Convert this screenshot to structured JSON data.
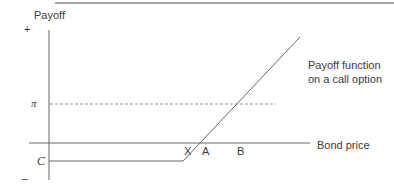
{
  "diagram": {
    "y_axis": {
      "label": "Payoff",
      "plus": "+",
      "minus": "–"
    },
    "x_axis": {
      "label": "Bond price"
    },
    "levels": {
      "pi": "π",
      "c": "C"
    },
    "points": [
      "X",
      "A",
      "B"
    ],
    "curve_label_line1": "Payoff function",
    "curve_label_line2": "on a call option",
    "colors": {
      "line": "#666666",
      "text": "#3a3a3a",
      "rule": "#8a8a8a"
    }
  }
}
